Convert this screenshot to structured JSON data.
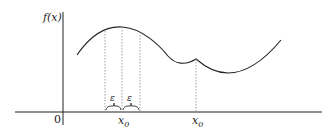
{
  "diagram": {
    "y_axis_label": "f(x)",
    "origin_label": "0",
    "epsilon_left": "ε",
    "epsilon_right": "ε",
    "x0_label": "x",
    "x0_sub": "0",
    "x0p_label": "x",
    "x0p_prime": "′",
    "x0p_sub": "0",
    "colors": {
      "line": "#222222",
      "dotted": "#888888"
    }
  }
}
